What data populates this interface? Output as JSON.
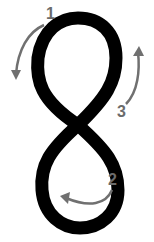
{
  "figure": {
    "digit": "8",
    "stroke_color": "#000000",
    "arrow_color": "#707070",
    "steps": [
      {
        "label": "1",
        "description": "start top, curve counter-clockwise down left"
      },
      {
        "label": "2",
        "description": "bottom loop, counter-clockwise"
      },
      {
        "label": "3",
        "description": "up right side back to top"
      }
    ]
  }
}
